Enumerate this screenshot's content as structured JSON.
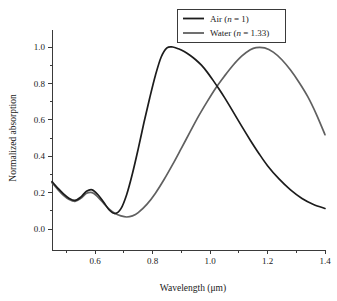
{
  "chart_data": {
    "type": "line",
    "title": "",
    "xlabel": "Wavelength (μm)",
    "ylabel": "Normalized absorption",
    "xlim": [
      0.45,
      1.4
    ],
    "ylim": [
      -0.06,
      1.06
    ],
    "grid": false,
    "legend_position": "top-right",
    "xticks": [
      0.6,
      0.8,
      1.0,
      1.2,
      1.4
    ],
    "xtick_labels": [
      "0.6",
      "0.8",
      "1.0",
      "1.2",
      "1.4"
    ],
    "xticks_minor": [
      0.5,
      0.7,
      0.9,
      1.1,
      1.3
    ],
    "yticks": [
      0.0,
      0.2,
      0.4,
      0.6,
      0.8,
      1.0
    ],
    "ytick_labels": [
      "0.0",
      "0.2",
      "0.4",
      "0.6",
      "0.8",
      "1.0"
    ],
    "series": [
      {
        "name": "Air",
        "legend_prefix": "Air (",
        "legend_italic": "n",
        "legend_suffix": " = 1)",
        "color": "#1c1c1c",
        "x": [
          0.45,
          0.47,
          0.49,
          0.51,
          0.53,
          0.55,
          0.57,
          0.59,
          0.61,
          0.63,
          0.65,
          0.67,
          0.69,
          0.71,
          0.73,
          0.75,
          0.77,
          0.79,
          0.81,
          0.83,
          0.85,
          0.87,
          0.89,
          0.91,
          0.93,
          0.95,
          0.97,
          0.99,
          1.01,
          1.03,
          1.05,
          1.08,
          1.11,
          1.14,
          1.17,
          1.2,
          1.24,
          1.28,
          1.32,
          1.36,
          1.4
        ],
        "y": [
          0.26,
          0.225,
          0.193,
          0.168,
          0.157,
          0.175,
          0.207,
          0.215,
          0.188,
          0.147,
          0.103,
          0.085,
          0.112,
          0.19,
          0.305,
          0.44,
          0.585,
          0.72,
          0.845,
          0.945,
          0.995,
          1.0,
          0.99,
          0.975,
          0.955,
          0.93,
          0.9,
          0.862,
          0.818,
          0.772,
          0.723,
          0.645,
          0.565,
          0.488,
          0.415,
          0.348,
          0.275,
          0.215,
          0.168,
          0.135,
          0.113
        ]
      },
      {
        "name": "Water",
        "legend_prefix": "Water (",
        "legend_italic": "n",
        "legend_suffix": " = 1.33)",
        "color": "#606060",
        "x": [
          0.45,
          0.47,
          0.49,
          0.51,
          0.53,
          0.55,
          0.57,
          0.59,
          0.61,
          0.63,
          0.65,
          0.67,
          0.69,
          0.71,
          0.73,
          0.75,
          0.78,
          0.81,
          0.84,
          0.87,
          0.9,
          0.93,
          0.96,
          0.99,
          1.02,
          1.05,
          1.08,
          1.11,
          1.14,
          1.16,
          1.19,
          1.22,
          1.25,
          1.28,
          1.31,
          1.34,
          1.37,
          1.4
        ],
        "y": [
          0.255,
          0.218,
          0.185,
          0.162,
          0.152,
          0.168,
          0.196,
          0.2,
          0.175,
          0.14,
          0.108,
          0.085,
          0.072,
          0.066,
          0.072,
          0.09,
          0.135,
          0.197,
          0.272,
          0.355,
          0.443,
          0.532,
          0.62,
          0.7,
          0.775,
          0.84,
          0.9,
          0.95,
          0.985,
          0.997,
          0.995,
          0.972,
          0.93,
          0.873,
          0.805,
          0.727,
          0.63,
          0.518
        ]
      }
    ]
  }
}
